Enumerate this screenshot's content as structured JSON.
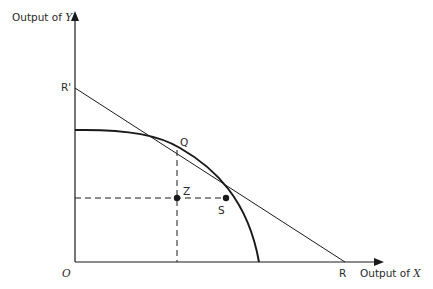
{
  "diagram": {
    "type": "production-possibility-frontier",
    "axes": {
      "y_label_prefix": "Output of ",
      "y_label_var": "Y",
      "x_label_prefix": "Output of ",
      "x_label_var": "X",
      "origin_label": "O"
    },
    "points": {
      "r_prime": "R'",
      "q": "Q",
      "z": "Z",
      "s": "S",
      "r": "R"
    },
    "colors": {
      "ink": "#1a1a1a",
      "background": "#ffffff"
    }
  }
}
